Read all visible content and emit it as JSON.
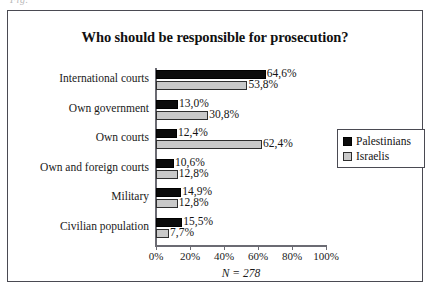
{
  "caption_fragment": "Fig.",
  "chart_data": {
    "type": "bar",
    "orientation": "horizontal",
    "title": "Who should be responsible for prosecution?",
    "xlabel": "",
    "ylabel": "",
    "note": "N = 278",
    "xlim": [
      0,
      100
    ],
    "grid": false,
    "legend_position": "right",
    "categories": [
      "International courts",
      "Own government",
      "Own courts",
      "Own and foreign courts",
      "Military",
      "Civilian population"
    ],
    "tick_labels": [
      "0%",
      "20%",
      "40%",
      "60%",
      "80%",
      "100%"
    ],
    "tick_values": [
      0,
      20,
      40,
      60,
      80,
      100
    ],
    "series": [
      {
        "name": "Palestinians",
        "color": "#0b0b0b",
        "values": [
          64.6,
          13.0,
          12.4,
          10.6,
          14.9,
          15.5
        ],
        "labels": [
          "64,6%",
          "13,0%",
          "12,4%",
          "10,6%",
          "14,9%",
          "15,5%"
        ]
      },
      {
        "name": "Israelis",
        "color": "#c9c9c9",
        "values": [
          53.8,
          30.8,
          62.4,
          12.8,
          12.8,
          7.7
        ],
        "labels": [
          "53,8%",
          "30,8%",
          "62,4%",
          "12,8%",
          "12,8%",
          "7,7%"
        ]
      }
    ]
  }
}
